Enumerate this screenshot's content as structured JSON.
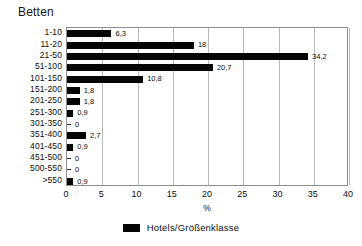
{
  "chart": {
    "title": "Betten",
    "axis_label_x": "%",
    "legend_label": "Hotels/Größenklasse",
    "bar_color": "#050505",
    "grid_color": "#b9b9b9",
    "axis_color": "#8d8d8d"
  },
  "chart_data": {
    "type": "bar",
    "orientation": "horizontal",
    "title": "Betten",
    "xlabel": "%",
    "ylabel": "",
    "xlim": [
      0,
      40
    ],
    "xticks": [
      0,
      5,
      10,
      15,
      20,
      25,
      30,
      35,
      40
    ],
    "xtick_labels": [
      "0",
      "5",
      "10",
      "15",
      "20",
      "25",
      "30",
      "35",
      "40"
    ],
    "grid": true,
    "grid_axis": "x",
    "legend": [
      "Hotels/Größenklasse"
    ],
    "legend_position": "bottom-center",
    "categories": [
      "1-10",
      "11-20",
      "21-50",
      "51-100",
      "101-150",
      "151-200",
      "201-250",
      "251-300",
      "301-350",
      "351-400",
      "401-450",
      "451-500",
      "500-550",
      ">550"
    ],
    "values": [
      6.3,
      18,
      34.2,
      20.7,
      10.8,
      1.8,
      1.8,
      0.9,
      0,
      2.7,
      0.9,
      0,
      0,
      0.9
    ],
    "data_labels": [
      "6,3",
      "18",
      "34,2",
      "20,7",
      "10,8",
      "1,8",
      "1,8",
      "0,9",
      "0",
      "2,7",
      "0,9",
      "0",
      "0",
      "0,9"
    ],
    "series": [
      {
        "name": "Hotels/Größenklasse",
        "values": [
          6.3,
          18,
          34.2,
          20.7,
          10.8,
          1.8,
          1.8,
          0.9,
          0,
          2.7,
          0.9,
          0,
          0,
          0.9
        ]
      }
    ]
  }
}
